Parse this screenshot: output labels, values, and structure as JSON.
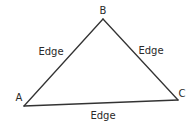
{
  "diagram": {
    "type": "triangle-graph",
    "colors": {
      "background": "#ffffff",
      "stroke": "#333333",
      "text": "#2a2a2a"
    },
    "vertices": [
      {
        "id": "A",
        "label": "A",
        "x": 24,
        "y": 106,
        "label_x": 19,
        "label_y": 98
      },
      {
        "id": "B",
        "label": "B",
        "x": 103,
        "y": 19,
        "label_x": 103,
        "label_y": 11
      },
      {
        "id": "C",
        "label": "C",
        "x": 178,
        "y": 100,
        "label_x": 182,
        "label_y": 94
      }
    ],
    "edges": [
      {
        "from": "A",
        "to": "B",
        "label": "Edge",
        "label_x": 51,
        "label_y": 52
      },
      {
        "from": "B",
        "to": "C",
        "label": "Edge",
        "label_x": 151,
        "label_y": 51
      },
      {
        "from": "A",
        "to": "C",
        "label": "Edge",
        "label_x": 103,
        "label_y": 116
      }
    ]
  }
}
